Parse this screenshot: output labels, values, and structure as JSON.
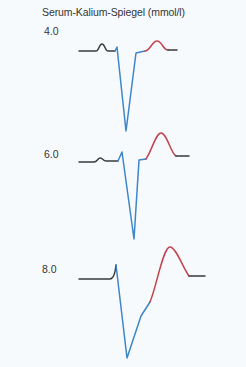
{
  "figure": {
    "title": "Serum-Kalium-Spiegel (mmol/l)",
    "colors": {
      "baseline": "#3a3a3a",
      "qrs": "#3d86c8",
      "t_wave": "#c2434d",
      "background": "#f7fafd"
    },
    "traces": [
      {
        "label": "4.0",
        "label_pos": {
          "x": 44,
          "y": 25
        },
        "segments": {
          "baseline": "M79,51 L96,51 C99,51 99,44 102,44 C105,44 105,51 108,51 L115,51",
          "qrs": "M115,51 L117,47 L126,131 L136,53 L145,51",
          "t_wave": "M145,51 C150,51 152,41 157,41 C162,41 163,50 168,50",
          "end": "M168,50 L177,50"
        }
      },
      {
        "label": "6.0",
        "label_pos": {
          "x": 44,
          "y": 148
        },
        "segments": {
          "baseline": "M79,162 L94,162 C97,162 98,158 100,158 C103,158 103,161 106,161 L118,161",
          "qrs": "M118,161 L122,152 L134,239 L139,160 L146,159",
          "t_wave": "M146,159 C152,150 156,133 161,133 C167,133 171,154 176,156",
          "end": "M176,156 L189,156"
        }
      },
      {
        "label": "8.0",
        "label_pos": {
          "x": 42,
          "y": 263
        },
        "segments": {
          "baseline": "M79,279 L110,279 C113,279 115,275 116,265",
          "qrs": "M116,265 L127,358 L141,316 L150,302",
          "t_wave": "M150,302 C157,285 163,247 170,247 C176,247 183,268 189,276",
          "end": "M189,276 L205,276"
        }
      }
    ]
  }
}
